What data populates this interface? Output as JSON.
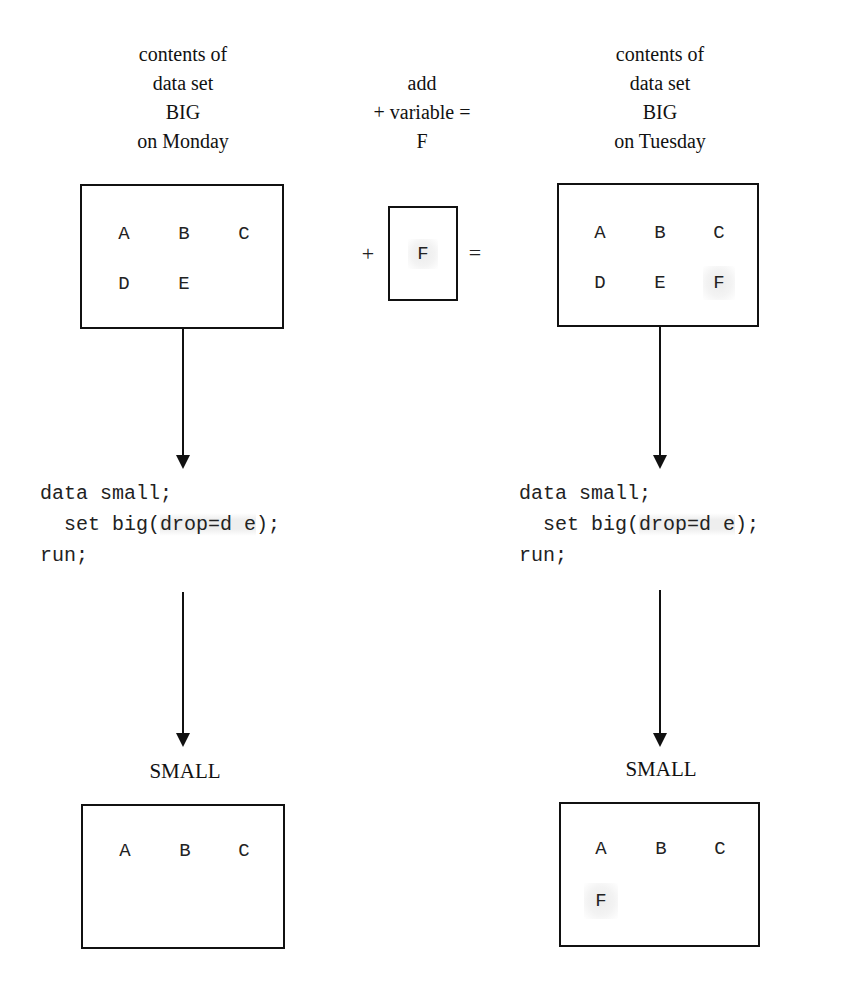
{
  "left_header": {
    "lines": [
      "contents of",
      "data set",
      "BIG",
      "on Monday"
    ]
  },
  "middle_header": {
    "lines": [
      "add",
      "+ variable =",
      "F"
    ]
  },
  "right_header": {
    "lines": [
      "contents of",
      "data set",
      "BIG",
      "on Tuesday"
    ]
  },
  "monday_big": {
    "variables": [
      "A",
      "B",
      "C",
      "D",
      "E"
    ]
  },
  "add_operation": {
    "plus": "+",
    "variable": "F",
    "equals": "="
  },
  "tuesday_big": {
    "variables": [
      "A",
      "B",
      "C",
      "D",
      "E",
      "F"
    ],
    "new_variable": "F"
  },
  "left_code": {
    "line1": "data small;",
    "line2_prefix": "  set big(",
    "line2_option": "drop=d e",
    "line2_suffix": ");",
    "line3": "run;"
  },
  "right_code": {
    "line1": "data small;",
    "line2_prefix": "  set big(",
    "line2_option": "drop=d e",
    "line2_suffix": ");",
    "line3": "run;"
  },
  "left_result": {
    "label": "SMALL",
    "variables": [
      "A",
      "B",
      "C"
    ]
  },
  "right_result": {
    "label": "SMALL",
    "variables": [
      "A",
      "B",
      "C",
      "F"
    ],
    "new_variable": "F"
  },
  "colors": {
    "line": "#111111",
    "highlight": "#eeeeee",
    "background": "#ffffff"
  }
}
